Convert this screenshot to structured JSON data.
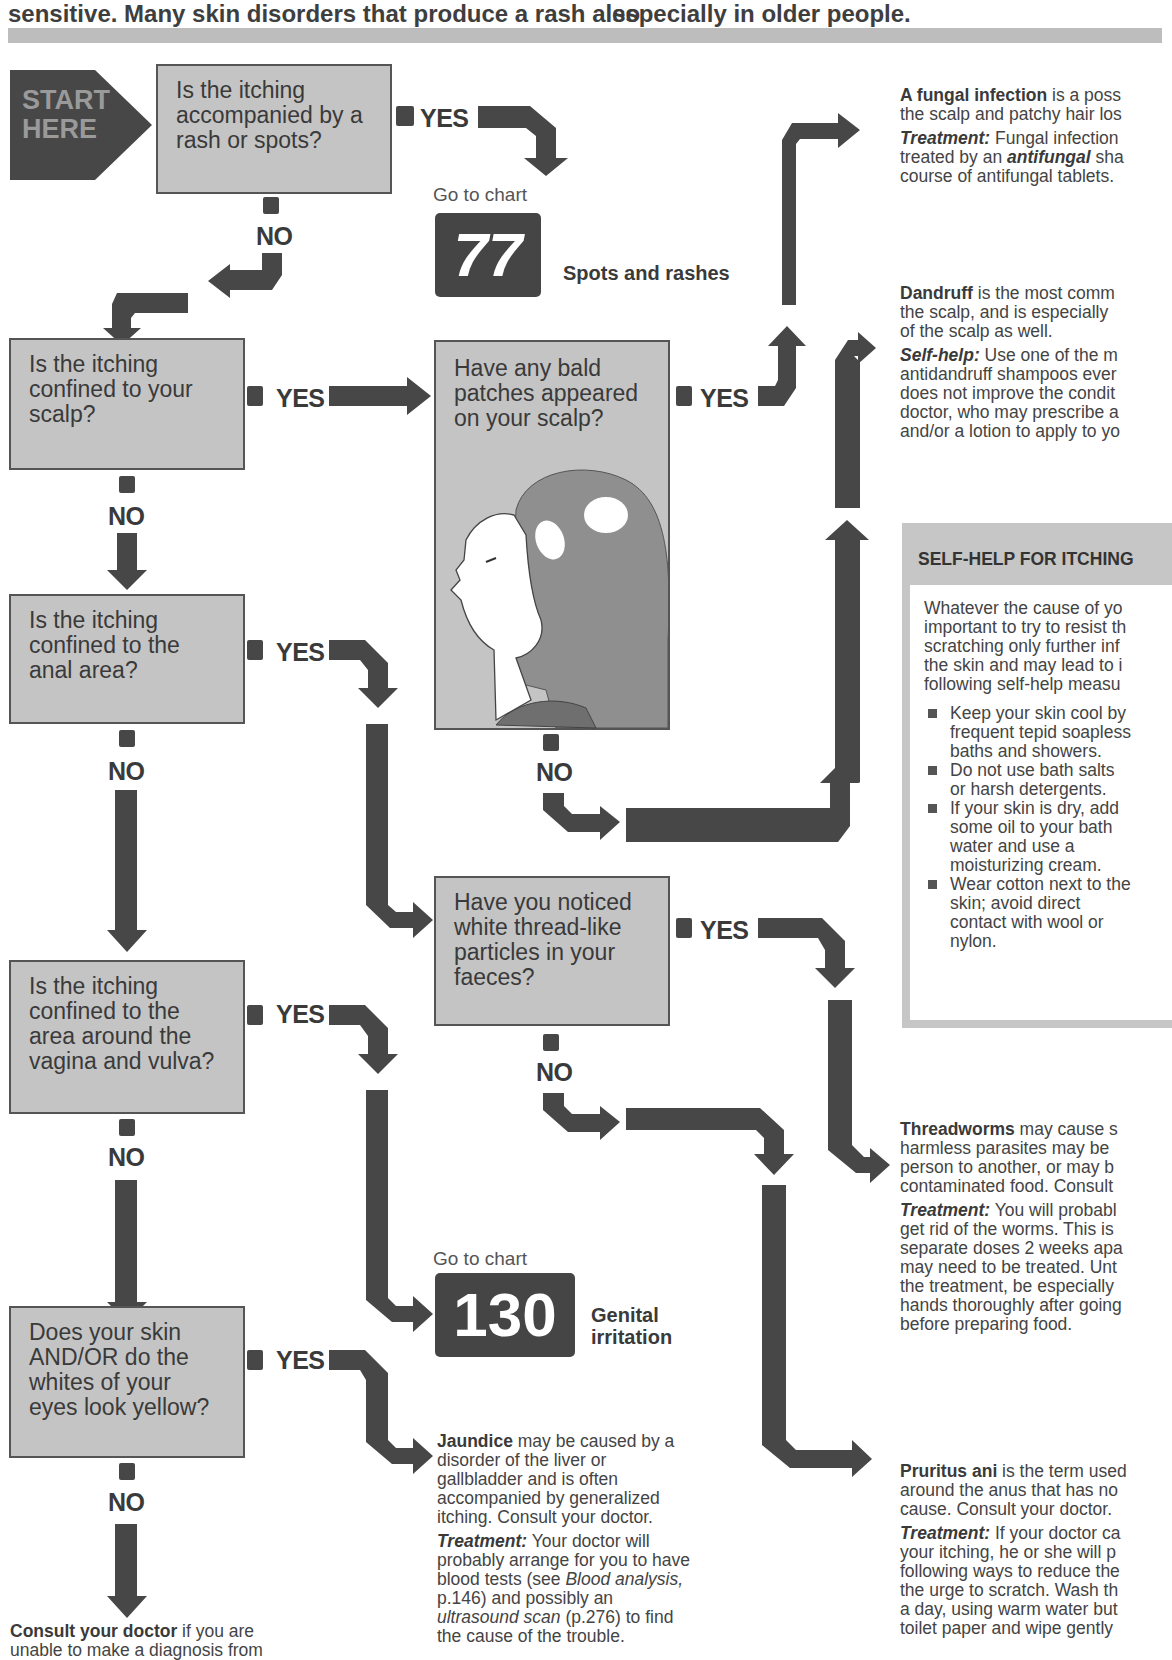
{
  "header": {
    "left_text": "sensitive. Many skin disorders that produce a rash also",
    "right_text": "especially in older people."
  },
  "start": {
    "label_line1": "START",
    "label_line2": "HERE"
  },
  "labels": {
    "yes": "YES",
    "no": "NO",
    "go_to_chart": "Go to chart"
  },
  "questions": [
    {
      "id": "q1",
      "text": "Is the itching accompanied by a rash or spots?"
    },
    {
      "id": "q2",
      "text": "Is the itching confined to your scalp?"
    },
    {
      "id": "q3",
      "text": "Have any bald patches appeared on your scalp?"
    },
    {
      "id": "q4",
      "text": "Is the itching confined to the anal area?"
    },
    {
      "id": "q5",
      "text": "Have you noticed white thread-like particles in your faeces?"
    },
    {
      "id": "q6",
      "text": "Is the itching confined to the area around the vagina and vulva?"
    },
    {
      "id": "q7",
      "text": "Does your skin AND/OR do the whites of your eyes look yellow?"
    }
  ],
  "chart_refs": [
    {
      "number": "77",
      "label": "Spots and rashes"
    },
    {
      "number": "130",
      "label_line1": "Genital",
      "label_line2": "irritation"
    }
  ],
  "outcomes": {
    "fungal": {
      "title": "A fungal infection",
      "line1_rest": " is a poss",
      "line2": "the scalp and patchy hair los",
      "treatment_label": "Treatment:",
      "treatment_line1_rest": " Fungal infection",
      "treatment_line2_pre": "treated by an ",
      "treatment_line2_em": "antifungal",
      "treatment_line2_post": " sha",
      "treatment_line3": "course of antifungal tablets."
    },
    "dandruff": {
      "title": "Dandruff",
      "line1_rest": " is the most comm",
      "line2": "the scalp, and is especially",
      "line3": "of the scalp as well.",
      "selfhelp_label": "Self-help:",
      "selfhelp_line1_rest": " Use one of the m",
      "selfhelp_line2": "antidandruff shampoos ever",
      "selfhelp_line3": "does not improve the condit",
      "selfhelp_line4": "doctor, who may prescribe a",
      "selfhelp_line5": "and/or a lotion to apply to yo"
    },
    "threadworms": {
      "title": "Threadworms",
      "line1_rest": " may cause s",
      "line2": "harmless parasites may be",
      "line3": "person to another, or may b",
      "line4": "contaminated food. Consult",
      "treatment_label": "Treatment:",
      "treatment_line1_rest": " You will probabl",
      "treatment_line2": "get rid of the worms. This is",
      "treatment_line3": "separate doses 2 weeks apa",
      "treatment_line4": "may need to be treated. Unt",
      "treatment_line5": "the treatment, be especially",
      "treatment_line6": "hands thoroughly after going",
      "treatment_line7": "before preparing food."
    },
    "pruritus": {
      "title": "Pruritus ani",
      "line1_rest": " is the term used",
      "line2": "around the anus that has no",
      "line3": "cause. Consult your doctor.",
      "treatment_label": "Treatment:",
      "treatment_line1_rest": " If your doctor ca",
      "treatment_line2": "your itching, he or she will p",
      "treatment_line3": "following ways to reduce the",
      "treatment_line4": "the urge to scratch. Wash th",
      "treatment_line5": "a day, using warm water but",
      "treatment_line6": "toilet paper and wipe gently"
    },
    "jaundice": {
      "title": "Jaundice",
      "line1_rest": " may be caused by a",
      "line2": "disorder of the liver or",
      "line3": "gallbladder and is often",
      "line4": "accompanied by generalized",
      "line5": "itching. Consult your doctor.",
      "treatment_label": "Treatment:",
      "treatment_line1_rest": " Your doctor will",
      "treatment_line2": "probably arrange for you to have",
      "treatment_line3_pre": "blood tests (see ",
      "treatment_line3_em": "Blood analysis,",
      "treatment_line4": "p.146) and possibly an",
      "treatment_line5_em": "ultrasound scan",
      "treatment_line5_post": " (p.276) to find",
      "treatment_line6": "the cause of the trouble."
    },
    "consult": {
      "title": "Consult your doctor",
      "line1_rest": " if you are",
      "line2": "unable to make a diagnosis from"
    }
  },
  "selfhelp_box": {
    "title": "SELF-HELP FOR ITCHING",
    "intro_lines": [
      "Whatever the cause of yo",
      "important to try to resist th",
      "scratching only further inf",
      "the skin and may lead to i",
      "following self-help measu"
    ],
    "items": [
      "Keep your skin cool by frequent tepid soapless baths and showers.",
      "Do not use bath salts or harsh detergents.",
      "If your skin is dry, add some oil to your bath water and use a moisturizing cream.",
      "Wear cotton next to the skin; avoid direct contact with wool or nylon."
    ]
  },
  "colors": {
    "arrow": "#474747",
    "question_box": "#c4c4c4",
    "chart_number_box": "#454545",
    "top_bar": "#bdbdbd",
    "text": "#3b3b3b"
  }
}
